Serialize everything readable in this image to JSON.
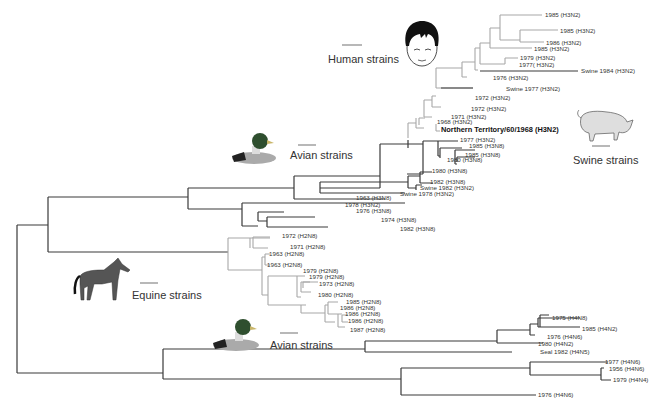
{
  "figure": {
    "type": "phylogenetic-tree",
    "colors": {
      "dark_branch": "#3a3a3a",
      "light_branch": "#a8a8a8",
      "text": "#333333"
    }
  },
  "groups": {
    "human": "Human strains",
    "swine": "Swine strains",
    "avian_top": "Avian strains",
    "equine": "Equine strains",
    "avian_bottom": "Avian strains"
  },
  "leaves": {
    "h1": "1985 (H3N2)",
    "h2": "1985 (H3N2)",
    "h3": "1986 (H3N2)",
    "h4": "1985 (H3N2)",
    "h5": "1979 (H3N2)",
    "h6": "1977( H3N2)",
    "h7": "Swine 1984 (H3N2)",
    "h8": "1976 (H3N2)",
    "h9": "Swine 1977 (H3N2)",
    "h10": "1972 (H3N2)",
    "h11": "1972 (H3N2)",
    "h12": "1971 (H3N2)",
    "h13": "1968 (H3N2)",
    "nt": "Northern Territory/60/1968 (H3N2)",
    "a1": "1977 (H3N2)",
    "a2": "1985 (H3N8)",
    "a3": "1985 (H3N8)",
    "a4": "1980 (H3N8)",
    "a5": "1980 (H3N8)",
    "a6": "1982 (H3N8)",
    "a7": "Swine 1982 (H3N2)",
    "a8": "Swine 1978 (H3N2)",
    "a9": "1963 (H3N8)",
    "a10": "1978 (H3N2)",
    "a11": "1976 (H3N8)",
    "a12": "1974 (H3N8)",
    "a13": "1982 (H3N8)",
    "e1": "1972 (H2N8)",
    "e2": "1971 (H2N8)",
    "e3": "1963 (H2N8)",
    "e4": "1963 (H2N8)",
    "e5": "1979 (H2N8)",
    "e6": "1979 (H2N8)",
    "e7": "1973 (H2N8)",
    "e8": "1980 (H2N8)",
    "e9": "1985 (H2N8)",
    "e10": "1986 (H2N8)",
    "e11": "1986 (H2N8)",
    "e12": "1986 (H2N8)",
    "e13": "1987 (H2N8)",
    "b1": "1975 (H4N8)",
    "b2": "1985 (H4N2)",
    "b3": "1976 (H4N6)",
    "b4": "1980 (H4N2)",
    "b5": "Seal 1982 (H4N5)",
    "b6": "1977 (H4N6)",
    "b7": "1956 (H4N6)",
    "b8": "1979 (H4N4)",
    "b9": "1976 (H4N6)"
  }
}
